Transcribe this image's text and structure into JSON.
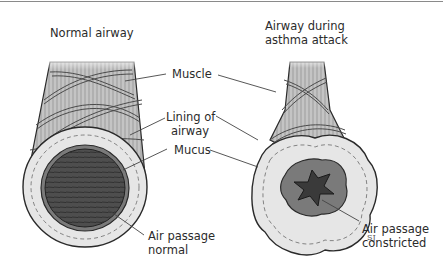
{
  "diagram": {
    "panels": [
      {
        "id": "normal",
        "title": "Normal airway"
      },
      {
        "id": "asthma",
        "title_line1": "Airway during",
        "title_line2": "asthma attack"
      }
    ],
    "labels": {
      "muscle": "Muscle",
      "lining_line1": "Lining of",
      "lining_line2": "airway",
      "mucus": "Mucus",
      "air_normal_line1": "Air passage",
      "air_normal_line2": "normal",
      "air_constricted_line1": "Air passage",
      "air_constricted_line2": "constricted"
    },
    "signature": "SJ",
    "colors": {
      "outline": "#2a2a2a",
      "muscle_fill": "#b8b8b8",
      "lining_fill": "#e8e8e8",
      "lumen_fill": "#5a5a5a",
      "mucus_fill": "#7a7a7a",
      "leader_line": "#444444"
    }
  }
}
